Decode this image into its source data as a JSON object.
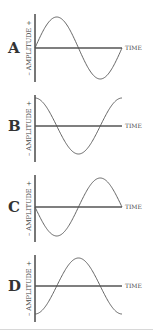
{
  "panels": [
    {
      "letter": "A",
      "y_label": "– AMPLITUDE +",
      "x_label": "TIME",
      "wave": "sine",
      "top": 14,
      "baseline": 48,
      "bottom": 82
    },
    {
      "letter": "B",
      "y_label": "– AMPLITUDE +",
      "x_label": "TIME",
      "wave": "cosine",
      "top": 95,
      "baseline": 126,
      "bottom": 162
    },
    {
      "letter": "C",
      "y_label": "– AMPLITUDE +",
      "x_label": "TIME",
      "wave": "negative-sine",
      "top": 175,
      "baseline": 207,
      "bottom": 242
    },
    {
      "letter": "D",
      "y_label": "– AMPLITUDE +",
      "x_label": "TIME",
      "wave": "negative-cosine",
      "top": 255,
      "baseline": 286,
      "bottom": 322
    }
  ],
  "colors": {
    "line": "#555555",
    "text": "#333333",
    "separator": "#d8d8d8"
  }
}
